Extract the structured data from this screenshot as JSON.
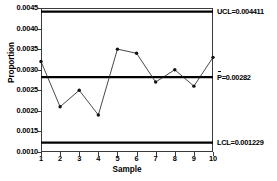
{
  "chart_data": {
    "type": "line",
    "chart_kind": "p-control-chart",
    "title": "",
    "xlabel": "Sample",
    "ylabel": "Proportion",
    "x": [
      1,
      2,
      3,
      4,
      5,
      6,
      7,
      8,
      9,
      10
    ],
    "values": [
      0.0032,
      0.0021,
      0.0025,
      0.0019,
      0.0035,
      0.0034,
      0.0027,
      0.003,
      0.0026,
      0.0033
    ],
    "series": [
      {
        "name": "Proportion",
        "values": [
          0.0032,
          0.0021,
          0.0025,
          0.0019,
          0.0035,
          0.0034,
          0.0027,
          0.003,
          0.0026,
          0.0033
        ]
      }
    ],
    "ylim": [
      0.001,
      0.0045
    ],
    "xlim": [
      1,
      10
    ],
    "ytick_labels": [
      "0.0045",
      "0.0040",
      "0.0035",
      "0.0030",
      "0.0025",
      "0.0020",
      "0.0015",
      "0.0010"
    ],
    "ytick_values": [
      0.0045,
      0.004,
      0.0035,
      0.003,
      0.0025,
      0.002,
      0.0015,
      0.001
    ],
    "xtick_labels": [
      "1",
      "2",
      "3",
      "4",
      "5",
      "6",
      "7",
      "8",
      "9",
      "10"
    ],
    "grid": false,
    "legend": "none",
    "control_limits": {
      "ucl": {
        "value": 0.004411,
        "label": "UCL=0.004411"
      },
      "center": {
        "value": 0.00282,
        "label_prefix": "P",
        "label_suffix": "=0.00282",
        "label": "P=0.00282"
      },
      "lcl": {
        "value": 0.001229,
        "label": "LCL=0.001229"
      }
    },
    "marker": "filled-circle",
    "line_color": "#1a1a1a",
    "limit_color": "#000000"
  }
}
